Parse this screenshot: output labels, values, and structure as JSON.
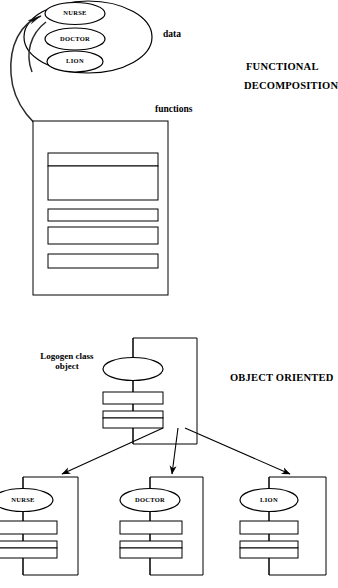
{
  "diagram": {
    "title_functional": "FUNCTIONAL",
    "title_functional_2": "DECOMPOSITION",
    "title_oo": "OBJECT ORIENTED",
    "label_data": "data",
    "label_functions": "functions",
    "label_logogen_line1": "Logogen  class",
    "label_logogen_line2": "object",
    "data_entities": [
      {
        "name": "NURSE"
      },
      {
        "name": "DOCTOR"
      },
      {
        "name": "LION"
      }
    ],
    "oo_subclasses": [
      {
        "name": "NURSE"
      },
      {
        "name": "DOCTOR"
      },
      {
        "name": "LION"
      }
    ],
    "oo_parent": {
      "name": ""
    },
    "colors": {
      "stroke": "#000000",
      "background": "#ffffff",
      "curve": "#2b2b2b"
    }
  }
}
